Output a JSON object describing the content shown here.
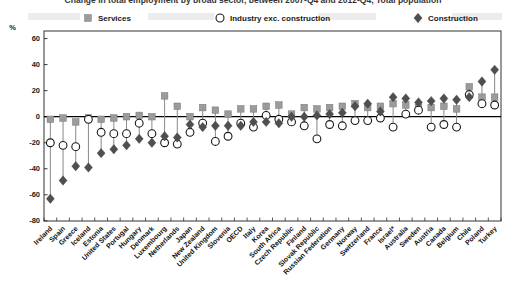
{
  "figure": {
    "cropped_title": "Change in total employment by broad sector, between 2007-Q4 and 2012-Q4, Total population",
    "percent_label": "%"
  },
  "chart_data": {
    "type": "scatter",
    "subtype": "lollipop-categorical",
    "ylim": [
      -80,
      60
    ],
    "yticks": [
      60,
      40,
      20,
      0,
      -20,
      -40,
      -60,
      -80
    ],
    "grid": false,
    "legend_position": "top",
    "legend": [
      {
        "label": "Services",
        "marker": "square",
        "color": "#9b9b9b"
      },
      {
        "label": "Industry exc. construction",
        "marker": "circle",
        "color": "#ffffff"
      },
      {
        "label": "Construction",
        "marker": "diamond",
        "color": "#4f4f4f"
      }
    ],
    "categories": [
      "Ireland",
      "Spain",
      "Greece",
      "Iceland",
      "Estonia",
      "United States",
      "Portugal",
      "Hungary",
      "Denmark",
      "Luxembourg",
      "Netherlands",
      "Japan",
      "New Zealand",
      "United Kingdom",
      "Slovenia",
      "OECD",
      "Italy",
      "Korea",
      "South Africa",
      "Czech Republic",
      "Finland",
      "Slovak Republic",
      "Russian Federation",
      "Germany",
      "Norway",
      "Switzerland",
      "France",
      "Israel*",
      "Australia",
      "Sweden",
      "Austria",
      "Canada",
      "Belgium",
      "Chile",
      "Poland",
      "Turkey"
    ],
    "bold_category": "OECD",
    "series": [
      {
        "name": "Services",
        "marker": "square",
        "values": [
          -2,
          -1,
          -4,
          -1,
          -2,
          -1,
          0,
          1,
          0,
          16,
          8,
          0,
          7,
          5,
          2,
          6,
          6,
          8,
          9,
          2,
          7,
          6,
          7,
          8,
          10,
          7,
          8,
          10,
          9,
          7,
          7,
          8,
          6,
          23,
          15,
          15
        ]
      },
      {
        "name": "Industry exc. construction",
        "marker": "circle",
        "values": [
          -20,
          -22,
          -23,
          -2,
          -12,
          -13,
          -13,
          -5,
          -13,
          -20,
          -21,
          -12,
          -5,
          -19,
          -15,
          -5,
          -8,
          1,
          -2,
          -4,
          -7,
          -17,
          -6,
          -7,
          -3,
          -3,
          -1,
          -8,
          2,
          5,
          -8,
          -6,
          -8,
          17,
          10,
          9
        ]
      },
      {
        "name": "Construction",
        "marker": "diamond",
        "values": [
          -63,
          -49,
          -38,
          -39,
          -28,
          -25,
          -22,
          -17,
          -20,
          -15,
          -16,
          -6,
          -8,
          -7,
          -7,
          -7,
          -4,
          -4,
          -5,
          0,
          0,
          1,
          2,
          3,
          8,
          10,
          4,
          15,
          14,
          11,
          12,
          14,
          13,
          15,
          27,
          36
        ]
      }
    ]
  }
}
